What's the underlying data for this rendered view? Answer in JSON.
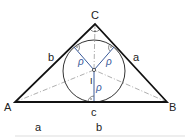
{
  "diagram": {
    "vertices": {
      "A": "A",
      "B": "B",
      "C": "C"
    },
    "sides": {
      "a": "a",
      "b": "b",
      "c": "c"
    },
    "incenter": "I",
    "radius_label": "ρ",
    "bottom_labels": {
      "left": "a",
      "right": "b"
    },
    "colors": {
      "triangle": "#111111",
      "circle": "#333333",
      "radius": "#3a5a9a",
      "bisector": "#aaaaaa"
    }
  }
}
